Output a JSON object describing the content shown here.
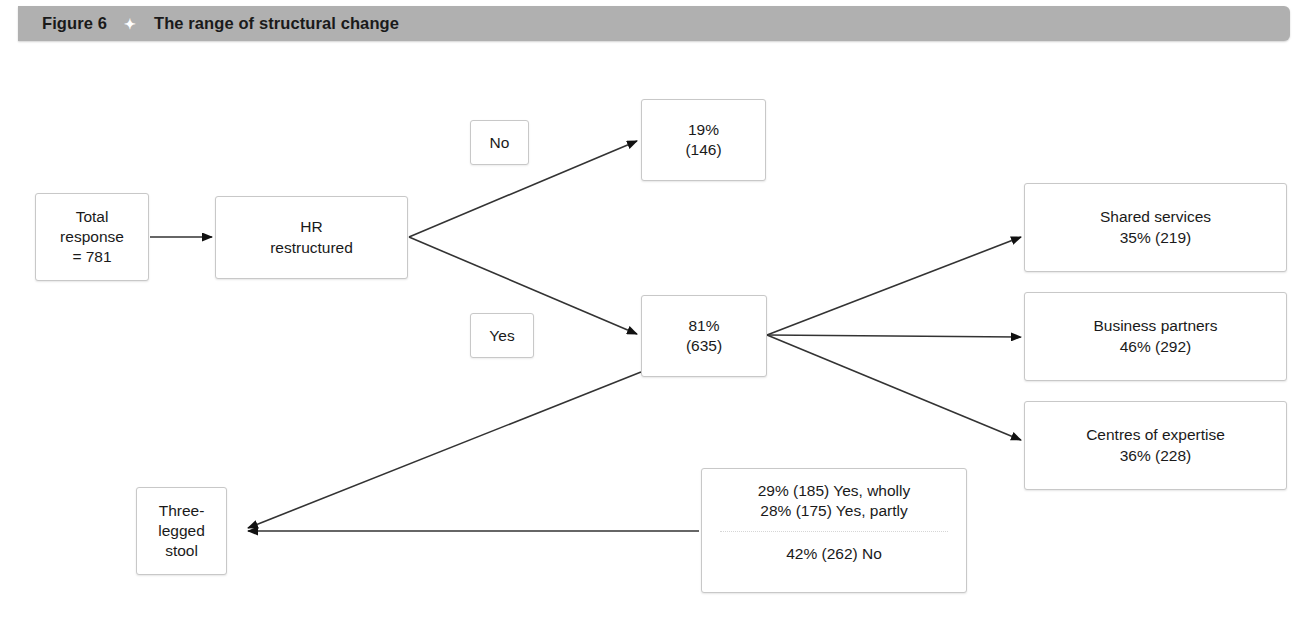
{
  "figure": {
    "label": "Figure 6",
    "diamond_icon": "diamond-bullet-icon",
    "title": "The range of structural change",
    "bar_color": "#b0b0b0"
  },
  "diagram": {
    "type": "flowchart",
    "nodes": {
      "total_response": {
        "line1": "Total",
        "line2": "response",
        "line3": "= 781"
      },
      "hr_restructured": {
        "line1": "HR",
        "line2": "restructured"
      },
      "label_no": {
        "text": "No"
      },
      "label_yes": {
        "text": "Yes"
      },
      "no_outcome": {
        "line1": "19%",
        "line2": "(146)"
      },
      "yes_outcome": {
        "line1": "81%",
        "line2": "(635)"
      },
      "shared_services": {
        "line1": "Shared services",
        "line2": "35% (219)"
      },
      "business_partners": {
        "line1": "Business partners",
        "line2": "46% (292)"
      },
      "centres_of_expertise": {
        "line1": "Centres of expertise",
        "line2": "36% (228)"
      },
      "three_legged_stool": {
        "line1": "Three-",
        "line2": "legged",
        "line3": "stool"
      },
      "stool_breakdown": {
        "top1": "29% (185) Yes, wholly",
        "top2": "28% (175) Yes, partly",
        "bottom1": "42% (262) No"
      }
    },
    "edges": [
      {
        "from": "total_response",
        "to": "hr_restructured",
        "label": ""
      },
      {
        "from": "hr_restructured",
        "to": "no_outcome",
        "label": "No"
      },
      {
        "from": "hr_restructured",
        "to": "yes_outcome",
        "label": "Yes"
      },
      {
        "from": "yes_outcome",
        "to": "shared_services",
        "label": ""
      },
      {
        "from": "yes_outcome",
        "to": "business_partners",
        "label": ""
      },
      {
        "from": "yes_outcome",
        "to": "centres_of_expertise",
        "label": ""
      },
      {
        "from": "yes_outcome",
        "to": "three_legged_stool",
        "label": ""
      },
      {
        "from": "stool_breakdown",
        "to": "three_legged_stool",
        "label": ""
      }
    ]
  }
}
